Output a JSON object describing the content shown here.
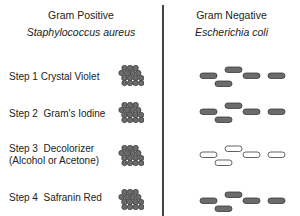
{
  "columns": {
    "positive": {
      "title": "Gram Positive",
      "species": "Staphylococcus aureus"
    },
    "negative": {
      "title": "Gram Negative",
      "species": "Escherichia coli"
    }
  },
  "steps": [
    {
      "label": "Step 1 Crystal Violet",
      "positive_stain": "dark",
      "negative_stain": "dark"
    },
    {
      "label": "Step 2  Gram's Iodine",
      "positive_stain": "dark",
      "negative_stain": "dark"
    },
    {
      "label": "Step 3  Decolorizer\n(Alcohol or Acetone)",
      "positive_stain": "dark",
      "negative_stain": "clear"
    },
    {
      "label": "Step 4  Safranin Red",
      "positive_stain": "dark",
      "negative_stain": "dark"
    }
  ],
  "colors": {
    "cell_fill": "#6b6b6b",
    "cell_stroke": "#3a3a3a",
    "clear_fill": "#ffffff",
    "divider": "#444444",
    "text": "#222222"
  }
}
